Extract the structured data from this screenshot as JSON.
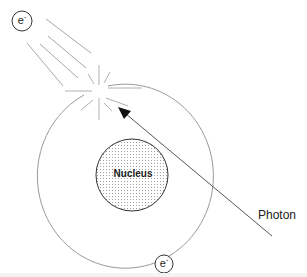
{
  "diagram": {
    "type": "atomic-photon-interaction",
    "labels": {
      "nucleus": "Nucleus",
      "photon": "Photon",
      "electron_symbol": "e",
      "electron_charge": "-"
    },
    "colors": {
      "orbit": "#9a9a9a",
      "nucleus_fill_dots": "#a0a0a0",
      "outline": "#333333",
      "arrow": "#555555",
      "trail_lines": "#a8a8a8",
      "text": "#222222"
    },
    "elements": {
      "orbit": {
        "cx": 133,
        "cy": 175,
        "rx": 88,
        "ry": 92
      },
      "nucleus": {
        "cx": 132,
        "cy": 175,
        "r": 36
      },
      "ejected_electron": {
        "cx": 22,
        "cy": 21,
        "r": 10
      },
      "orbital_electron": {
        "cx": 164,
        "cy": 264,
        "r": 9
      },
      "photon_arrow": {
        "from": [
          272,
          236
        ],
        "to": [
          118,
          107
        ]
      },
      "interaction_point": {
        "x": 98,
        "y": 92
      }
    }
  }
}
